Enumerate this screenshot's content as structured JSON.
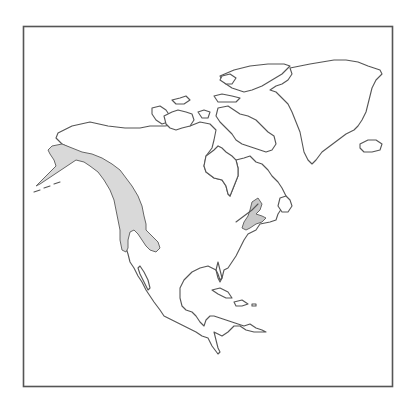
{
  "map": {
    "region": "North America",
    "frame_color": "#555555",
    "coastline_color": "#555555",
    "background_color": "#ffffff",
    "range_fill_color": "#d9d9d9",
    "range_areas": [
      {
        "name": "western-range",
        "description": "Alaska, western Canada, Pacific Northwest with Rocky Mountain extension"
      },
      {
        "name": "northeastern-range",
        "description": "Gulf of St. Lawrence / northern New England patch"
      }
    ]
  }
}
